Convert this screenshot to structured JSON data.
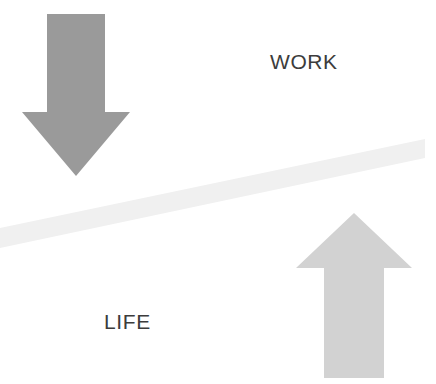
{
  "diagram": {
    "background_color": "#ffffff",
    "width": 436,
    "height": 384,
    "labels": {
      "work": "WORK",
      "life": "LIFE",
      "text_color": "#3c3c3c",
      "font_size_px": 21
    },
    "beam": {
      "name": "balance-beam",
      "color": "#f0f0f0",
      "orientation": "tilted-up-to-the-right",
      "left_end_y": 238,
      "right_end_y": 149,
      "thickness_px": 20,
      "points": "0,228 425,139 425,158 0,248"
    },
    "arrows": [
      {
        "name": "work-down-arrow",
        "direction": "down",
        "color": "#9a9a9a",
        "points": "47,14 105,14 105,112 130,112 76,176 22,112 47,112",
        "tip_x": 76,
        "tip_y": 176,
        "shaft_left": 47,
        "shaft_right": 105,
        "shaft_top": 14,
        "head_left": 22,
        "head_right": 130,
        "head_top": 112
      },
      {
        "name": "life-up-arrow",
        "direction": "up",
        "color": "#d2d2d2",
        "points": "354,213 412,268 384,268 384,378 324,378 324,268 296,268",
        "tip_x": 354,
        "tip_y": 213,
        "shaft_left": 324,
        "shaft_right": 384,
        "shaft_bottom": 378,
        "head_left": 296,
        "head_right": 412,
        "head_bottom": 268
      }
    ]
  }
}
